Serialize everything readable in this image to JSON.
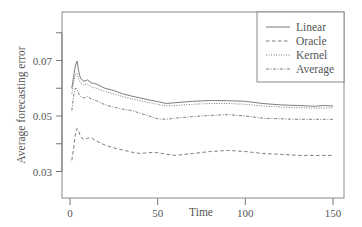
{
  "chart_data": {
    "type": "line",
    "title": "",
    "xlabel": "Time",
    "ylabel": "Average forecasting error",
    "xlim": [
      -3,
      157
    ],
    "ylim": [
      0.0265,
      0.0935
    ],
    "xticks": [
      0,
      50,
      100,
      150
    ],
    "xtick_labels": [
      "0",
      "50",
      "100",
      "150"
    ],
    "yticks": [
      0.03,
      0.04,
      0.05,
      0.06,
      0.07,
      0.08
    ],
    "ytick_labels": [
      "0.03",
      "",
      "0.05",
      "",
      "0.07",
      ""
    ],
    "grid": false,
    "legend_position": "top-right",
    "series": [
      {
        "name": "Linear",
        "style": "solid",
        "x": [
          1,
          2,
          3,
          4,
          5,
          6,
          8,
          10,
          12,
          15,
          20,
          25,
          30,
          35,
          40,
          45,
          50,
          55,
          60,
          70,
          80,
          90,
          100,
          110,
          120,
          130,
          140,
          145,
          150
        ],
        "values": [
          0.06,
          0.064,
          0.068,
          0.0698,
          0.066,
          0.0635,
          0.0625,
          0.063,
          0.062,
          0.0615,
          0.06,
          0.0592,
          0.058,
          0.0572,
          0.0565,
          0.0558,
          0.0552,
          0.0545,
          0.0548,
          0.0553,
          0.0556,
          0.0555,
          0.0553,
          0.0545,
          0.054,
          0.0538,
          0.0535,
          0.0538,
          0.0536
        ]
      },
      {
        "name": "Oracle",
        "style": "dashed",
        "x": [
          1,
          2,
          3,
          4,
          5,
          6,
          8,
          10,
          12,
          15,
          20,
          25,
          30,
          35,
          40,
          45,
          50,
          55,
          60,
          70,
          80,
          90,
          100,
          110,
          120,
          130,
          140,
          150
        ],
        "values": [
          0.034,
          0.038,
          0.043,
          0.0455,
          0.0445,
          0.0425,
          0.0415,
          0.042,
          0.0422,
          0.041,
          0.0395,
          0.0385,
          0.0378,
          0.037,
          0.0365,
          0.0368,
          0.0368,
          0.0362,
          0.0358,
          0.0365,
          0.0372,
          0.0376,
          0.0372,
          0.0365,
          0.0362,
          0.0358,
          0.0358,
          0.0358
        ]
      },
      {
        "name": "Kernel",
        "style": "dotted",
        "x": [
          1,
          2,
          3,
          4,
          5,
          6,
          8,
          10,
          12,
          15,
          20,
          25,
          30,
          35,
          40,
          45,
          50,
          55,
          60,
          70,
          80,
          90,
          100,
          110,
          120,
          130,
          140,
          150
        ],
        "values": [
          0.058,
          0.062,
          0.065,
          0.0655,
          0.063,
          0.062,
          0.0612,
          0.0615,
          0.0605,
          0.06,
          0.0588,
          0.058,
          0.057,
          0.0562,
          0.0555,
          0.0548,
          0.0542,
          0.0536,
          0.0538,
          0.0542,
          0.0545,
          0.0545,
          0.0542,
          0.0536,
          0.0532,
          0.053,
          0.0528,
          0.053
        ]
      },
      {
        "name": "Average",
        "style": "dash-dot",
        "x": [
          1,
          2,
          3,
          4,
          5,
          6,
          8,
          10,
          12,
          15,
          20,
          25,
          30,
          35,
          40,
          45,
          50,
          55,
          60,
          70,
          80,
          90,
          100,
          110,
          120,
          130,
          140,
          150
        ],
        "values": [
          0.052,
          0.057,
          0.06,
          0.0598,
          0.058,
          0.057,
          0.0565,
          0.057,
          0.0562,
          0.0555,
          0.054,
          0.0532,
          0.0525,
          0.052,
          0.051,
          0.05,
          0.049,
          0.0488,
          0.0492,
          0.0498,
          0.0502,
          0.0505,
          0.05,
          0.0492,
          0.049,
          0.0488,
          0.0488,
          0.0488
        ]
      }
    ]
  },
  "legend": {
    "items": [
      {
        "label": "Linear",
        "style": "solid"
      },
      {
        "label": "Oracle",
        "style": "dashed"
      },
      {
        "label": "Kernel",
        "style": "dotted"
      },
      {
        "label": "Average",
        "style": "dash-dot"
      }
    ]
  },
  "colors": {
    "line": "#6e6e6e",
    "axis": "#777777",
    "text": "#555555",
    "background": "#ffffff"
  }
}
